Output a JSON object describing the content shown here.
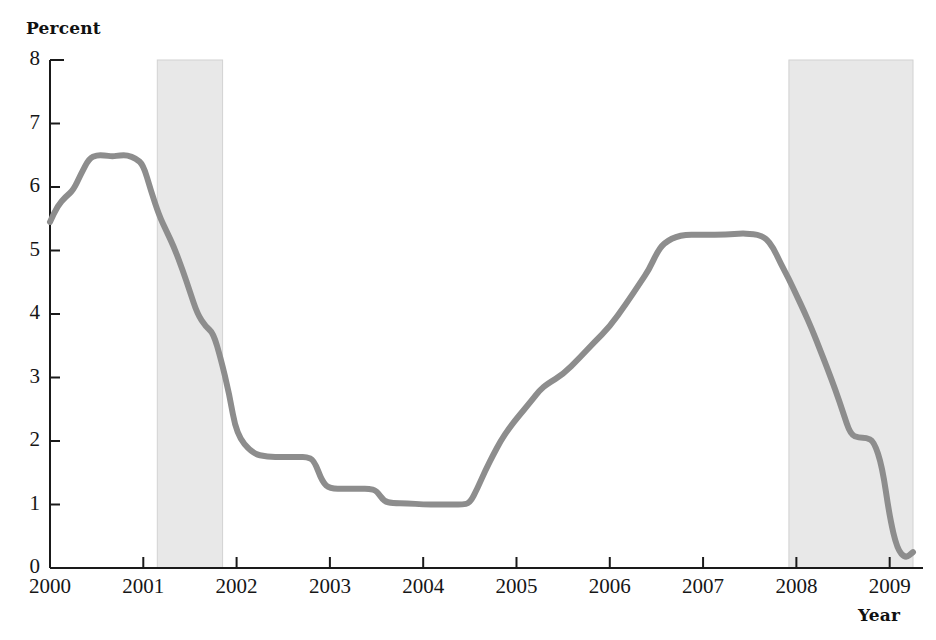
{
  "chart_data": {
    "type": "line",
    "title": "",
    "xlabel": "Year",
    "ylabel": "Percent",
    "xlim": [
      2000,
      2009.25
    ],
    "ylim": [
      0,
      8
    ],
    "grid": false,
    "legend": null,
    "line_color": "#8d8d8d",
    "shading_color": "#e8e8e8",
    "axis_color": "#1a1a1a",
    "x_ticks": [
      "2000",
      "2001",
      "2002",
      "2003",
      "2004",
      "2005",
      "2006",
      "2007",
      "2008",
      "2009"
    ],
    "x_tick_values": [
      2000,
      2001,
      2002,
      2003,
      2004,
      2005,
      2006,
      2007,
      2008,
      2009
    ],
    "y_ticks": [
      "0",
      "1",
      "2",
      "3",
      "4",
      "5",
      "6",
      "7",
      "8"
    ],
    "y_tick_values": [
      0,
      1,
      2,
      3,
      4,
      5,
      6,
      7,
      8
    ],
    "shaded_regions": [
      {
        "name": "recession-2001",
        "x0": 2001.15,
        "x1": 2001.85
      },
      {
        "name": "recession-2008",
        "x0": 2007.92,
        "x1": 2009.25
      }
    ],
    "series": [
      {
        "name": "Interest rate",
        "x": [
          2000.0,
          2000.08,
          2000.17,
          2000.25,
          2000.33,
          2000.42,
          2000.5,
          2000.58,
          2000.67,
          2000.75,
          2000.83,
          2000.92,
          2001.0,
          2001.08,
          2001.17,
          2001.25,
          2001.33,
          2001.42,
          2001.5,
          2001.58,
          2001.67,
          2001.75,
          2001.83,
          2001.92,
          2002.0,
          2002.17,
          2002.33,
          2002.5,
          2002.67,
          2002.75,
          2002.83,
          2002.92,
          2003.0,
          2003.17,
          2003.33,
          2003.42,
          2003.5,
          2003.58,
          2003.67,
          2003.83,
          2004.0,
          2004.17,
          2004.33,
          2004.42,
          2004.5,
          2004.58,
          2004.67,
          2004.75,
          2004.83,
          2004.92,
          2005.0,
          2005.17,
          2005.25,
          2005.33,
          2005.5,
          2005.67,
          2005.83,
          2006.0,
          2006.17,
          2006.33,
          2006.42,
          2006.5,
          2006.58,
          2006.75,
          2007.0,
          2007.25,
          2007.42,
          2007.5,
          2007.58,
          2007.67,
          2007.75,
          2007.83,
          2007.92,
          2008.0,
          2008.08,
          2008.17,
          2008.25,
          2008.33,
          2008.42,
          2008.5,
          2008.58,
          2008.67,
          2008.75,
          2008.83,
          2008.92,
          2009.0,
          2009.08,
          2009.17,
          2009.25
        ],
        "y": [
          5.45,
          5.7,
          5.85,
          5.95,
          6.2,
          6.45,
          6.5,
          6.5,
          6.48,
          6.5,
          6.5,
          6.45,
          6.35,
          5.95,
          5.55,
          5.3,
          5.05,
          4.7,
          4.35,
          4.0,
          3.8,
          3.7,
          3.3,
          2.75,
          2.1,
          1.8,
          1.75,
          1.75,
          1.75,
          1.75,
          1.7,
          1.35,
          1.25,
          1.25,
          1.25,
          1.25,
          1.22,
          1.05,
          1.02,
          1.02,
          1.0,
          1.0,
          1.0,
          1.0,
          1.02,
          1.25,
          1.55,
          1.78,
          2.0,
          2.2,
          2.35,
          2.65,
          2.8,
          2.9,
          3.05,
          3.3,
          3.55,
          3.8,
          4.15,
          4.5,
          4.7,
          4.95,
          5.12,
          5.25,
          5.25,
          5.25,
          5.27,
          5.26,
          5.25,
          5.2,
          5.05,
          4.8,
          4.55,
          4.3,
          4.05,
          3.75,
          3.45,
          3.15,
          2.8,
          2.45,
          2.1,
          2.05,
          2.05,
          2.0,
          1.6,
          0.8,
          0.3,
          0.15,
          0.25
        ]
      }
    ]
  },
  "labels": {
    "y_axis_title": "Percent",
    "x_axis_title": "Year"
  }
}
